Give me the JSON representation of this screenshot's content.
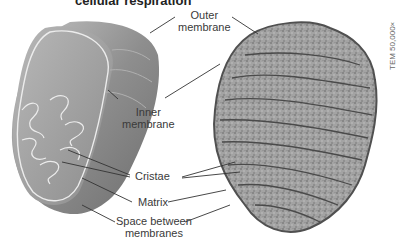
{
  "title": "cellular respiration",
  "labels": {
    "outer_membrane": [
      "Outer",
      "membrane"
    ],
    "inner_membrane": [
      "Inner",
      "membrane"
    ],
    "cristae": "Cristae",
    "matrix": "Matrix",
    "space_between": [
      "Space between",
      "membranes"
    ]
  },
  "magnification": "TEM 50,000×",
  "colors": {
    "illustration_outer": "#8a8a8a",
    "illustration_inner": "#a9a9a9",
    "membrane_line": "#e8e8e8",
    "micrograph_fill": "#9a9a9a",
    "micrograph_edge": "#555555",
    "leader_line": "#333333"
  }
}
